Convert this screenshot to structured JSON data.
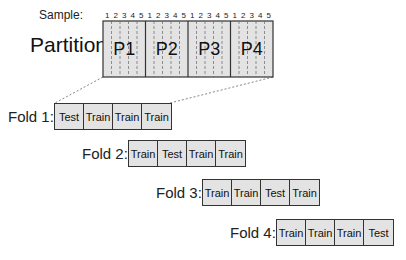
{
  "diagram": {
    "top_cropped_text": "",
    "sample_label": "Sample:",
    "partition_label": "Partition:",
    "samples_per_partition": [
      "1",
      "2",
      "3",
      "4",
      "5"
    ],
    "partitions": [
      "P1",
      "P2",
      "P3",
      "P4"
    ],
    "folds": [
      {
        "label": "Fold 1:",
        "cells": [
          "Test",
          "Train",
          "Train",
          "Train"
        ]
      },
      {
        "label": "Fold 2:",
        "cells": [
          "Train",
          "Test",
          "Train",
          "Train"
        ]
      },
      {
        "label": "Fold 3:",
        "cells": [
          "Train",
          "Train",
          "Test",
          "Train"
        ]
      },
      {
        "label": "Fold 4:",
        "cells": [
          "Train",
          "Train",
          "Train",
          "Test"
        ]
      }
    ],
    "colors": {
      "box_fill": "#e3e3e3",
      "stroke": "#333333",
      "dashed": "#666666"
    }
  }
}
